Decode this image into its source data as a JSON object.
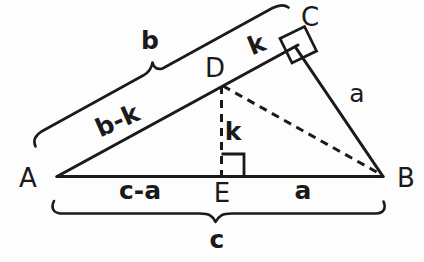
{
  "figure": {
    "ink_color": "#1a1a1a",
    "background_color": "#fdfdfd",
    "vertices": [
      {
        "name": "A",
        "label": "A",
        "x": 57,
        "y": 176,
        "label_x": 28,
        "label_y": 178
      },
      {
        "name": "B",
        "label": "B",
        "x": 383,
        "y": 176,
        "label_x": 406,
        "label_y": 178
      },
      {
        "name": "C",
        "label": "C",
        "x": 296,
        "y": 48,
        "label_x": 310,
        "label_y": 17
      },
      {
        "name": "D",
        "label": "D",
        "x": 222,
        "y": 85,
        "label_x": 215,
        "label_y": 68
      },
      {
        "name": "E",
        "label": "E",
        "x": 221,
        "y": 176,
        "label_x": 222,
        "label_y": 193
      }
    ],
    "solid_edges": [
      {
        "name": "edge-A-B",
        "from": "A",
        "to": "B"
      },
      {
        "name": "edge-A-C",
        "from": "A",
        "to": "C"
      },
      {
        "name": "edge-C-B",
        "from": "C",
        "to": "B"
      }
    ],
    "dashed_edges": [
      {
        "name": "edge-D-E",
        "from": "D",
        "to": "E"
      },
      {
        "name": "edge-D-B",
        "from": "D",
        "to": "B"
      }
    ],
    "right_angles": [
      {
        "name": "right-angle-at-C",
        "at": "C"
      },
      {
        "name": "right-angle-at-E",
        "at": "E"
      }
    ],
    "segment_labels": [
      {
        "name": "label-b",
        "text": "b",
        "x": 150,
        "y": 42,
        "rotate": 0
      },
      {
        "name": "label-k-upper",
        "text": "k",
        "x": 257,
        "y": 46,
        "rotate": -22
      },
      {
        "name": "label-b-minus-k",
        "text": "b-k",
        "x": 118,
        "y": 122,
        "rotate": -24
      },
      {
        "name": "label-a-right",
        "text": "a",
        "x": 357,
        "y": 95,
        "rotate": 0
      },
      {
        "name": "label-k-vertical",
        "text": "k",
        "x": 233,
        "y": 133,
        "rotate": 0
      },
      {
        "name": "label-c-minus-a",
        "text": "c-a",
        "x": 140,
        "y": 191,
        "rotate": 0
      },
      {
        "name": "label-a-bottom",
        "text": "a",
        "x": 303,
        "y": 191,
        "rotate": 0
      },
      {
        "name": "label-c",
        "text": "c",
        "x": 217,
        "y": 240,
        "rotate": 0
      }
    ],
    "braces": [
      {
        "name": "brace-b-along-AC",
        "measures": "b",
        "orientation": "diagonal-parallel-to-AC"
      },
      {
        "name": "brace-c-along-AB",
        "measures": "c",
        "orientation": "horizontal-below-AB"
      }
    ]
  }
}
